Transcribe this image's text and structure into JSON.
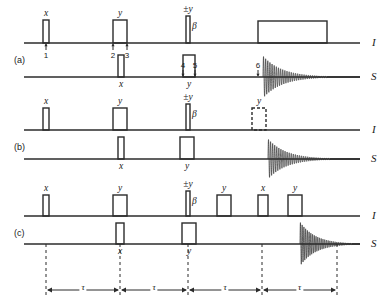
{
  "figure": {
    "type": "nmr-pulse-sequence-diagram",
    "width": 392,
    "height": 305,
    "line_color": "#2b2b2b",
    "background": "#ffffff"
  },
  "panels": [
    {
      "id": "a",
      "label": "(a)",
      "label_x": 14,
      "label_y": 55,
      "channels": [
        {
          "name": "I",
          "label": "I",
          "label_x": 372,
          "label_y": 36,
          "baseline_y": 43,
          "x0": 24,
          "x1": 360
        },
        {
          "name": "S",
          "label": "S",
          "label_x": 371,
          "label_y": 70,
          "baseline_y": 77,
          "x0": 24,
          "x1": 360
        }
      ],
      "pulses": [
        {
          "channel": "I",
          "x": 43,
          "w": 6,
          "h": 23,
          "style": "solid",
          "phase": "x",
          "phase_pos": "above"
        },
        {
          "channel": "I",
          "x": 113,
          "w": 14,
          "h": 23,
          "style": "solid",
          "phase": "y",
          "phase_pos": "above"
        },
        {
          "channel": "I",
          "x": 186,
          "w": 4,
          "h": 27,
          "style": "solid",
          "phase": "±y",
          "phase_pos": "above",
          "side_label": "β"
        },
        {
          "channel": "I",
          "x": 258,
          "w": 69,
          "h": 22,
          "style": "solid",
          "phase": "",
          "phase_pos": "none"
        },
        {
          "channel": "S",
          "x": 118,
          "w": 6,
          "h": 22,
          "style": "solid",
          "phase": "x",
          "phase_pos": "below"
        },
        {
          "channel": "S",
          "x": 183,
          "w": 12,
          "h": 22,
          "style": "solid",
          "phase": "y",
          "phase_pos": "below"
        }
      ],
      "markers": [
        {
          "n": "1",
          "x": 46,
          "y_tip": 43,
          "from": "below"
        },
        {
          "n": "2",
          "x": 113,
          "y_tip": 43,
          "from": "below"
        },
        {
          "n": "3",
          "x": 127,
          "y_tip": 43,
          "from": "below"
        },
        {
          "n": "4",
          "x": 183,
          "y_tip": 77,
          "from": "above"
        },
        {
          "n": "5",
          "x": 195,
          "y_tip": 77,
          "from": "above"
        },
        {
          "n": "6",
          "x": 258,
          "y_tip": 77,
          "from": "above"
        }
      ],
      "fid": {
        "channel": "S",
        "x_start": 263,
        "x_end": 327,
        "amplitude": 21,
        "baseline_y": 77
      }
    },
    {
      "id": "b",
      "label": "(b)",
      "label_x": 14,
      "label_y": 142,
      "channels": [
        {
          "name": "I",
          "label": "I",
          "label_x": 372,
          "label_y": 123,
          "baseline_y": 130,
          "x0": 24,
          "x1": 360
        },
        {
          "name": "S",
          "label": "S",
          "label_x": 371,
          "label_y": 152,
          "baseline_y": 159,
          "x0": 24,
          "x1": 360
        }
      ],
      "pulses": [
        {
          "channel": "I",
          "x": 43,
          "w": 6,
          "h": 22,
          "style": "solid",
          "phase": "x",
          "phase_pos": "above"
        },
        {
          "channel": "I",
          "x": 113,
          "w": 14,
          "h": 22,
          "style": "solid",
          "phase": "y",
          "phase_pos": "above"
        },
        {
          "channel": "I",
          "x": 186,
          "w": 4,
          "h": 26,
          "style": "solid",
          "phase": "±y",
          "phase_pos": "above",
          "side_label": "β"
        },
        {
          "channel": "I",
          "x": 252,
          "w": 14,
          "h": 22,
          "style": "dashed",
          "phase": "y",
          "phase_pos": "above"
        },
        {
          "channel": "S",
          "x": 118,
          "w": 6,
          "h": 22,
          "style": "solid",
          "phase": "x",
          "phase_pos": "below"
        },
        {
          "channel": "S",
          "x": 180,
          "w": 14,
          "h": 22,
          "style": "solid",
          "phase": "y",
          "phase_pos": "below"
        }
      ],
      "markers": [],
      "fid": {
        "channel": "S",
        "x_start": 268,
        "x_end": 330,
        "amplitude": 20,
        "baseline_y": 159
      }
    },
    {
      "id": "c",
      "label": "(c)",
      "label_x": 14,
      "label_y": 228,
      "channels": [
        {
          "name": "I",
          "label": "I",
          "label_x": 372,
          "label_y": 209,
          "baseline_y": 216,
          "x0": 24,
          "x1": 360
        },
        {
          "name": "S",
          "label": "S",
          "label_x": 371,
          "label_y": 237,
          "baseline_y": 244,
          "x0": 24,
          "x1": 360
        }
      ],
      "pulses": [
        {
          "channel": "I",
          "x": 43,
          "w": 6,
          "h": 21,
          "style": "solid",
          "phase": "x",
          "phase_pos": "above"
        },
        {
          "channel": "I",
          "x": 113,
          "w": 14,
          "h": 21,
          "style": "solid",
          "phase": "y",
          "phase_pos": "above"
        },
        {
          "channel": "I",
          "x": 186,
          "w": 4,
          "h": 25,
          "style": "solid",
          "phase": "±y",
          "phase_pos": "above",
          "side_label": "β"
        },
        {
          "channel": "I",
          "x": 217,
          "w": 14,
          "h": 21,
          "style": "solid",
          "phase": "y",
          "phase_pos": "above"
        },
        {
          "channel": "I",
          "x": 258,
          "w": 10,
          "h": 21,
          "style": "solid",
          "phase": "x",
          "phase_pos": "above"
        },
        {
          "channel": "I",
          "x": 288,
          "w": 14,
          "h": 21,
          "style": "solid",
          "phase": "y",
          "phase_pos": "above"
        },
        {
          "channel": "S",
          "x": 116,
          "w": 8,
          "h": 21,
          "style": "solid",
          "phase": "x",
          "phase_pos": "below"
        },
        {
          "channel": "S",
          "x": 182,
          "w": 14,
          "h": 21,
          "style": "solid",
          "phase": "y",
          "phase_pos": "below"
        }
      ],
      "markers": [],
      "fid": {
        "channel": "S",
        "x_start": 300,
        "x_end": 352,
        "amplitude": 22,
        "baseline_y": 244
      }
    }
  ],
  "timing": {
    "dashed_top_y": 244,
    "dashed_bottom_y": 296,
    "arrow_y": 290,
    "dashed_x": [
      46,
      120,
      188,
      262,
      337
    ],
    "intervals": [
      {
        "label": "τ",
        "x_left": 46,
        "x_right": 120
      },
      {
        "label": "τ",
        "x_left": 120,
        "x_right": 188
      },
      {
        "label": "τ",
        "x_left": 188,
        "x_right": 262
      },
      {
        "label": "τ",
        "x_left": 262,
        "x_right": 337
      }
    ]
  }
}
